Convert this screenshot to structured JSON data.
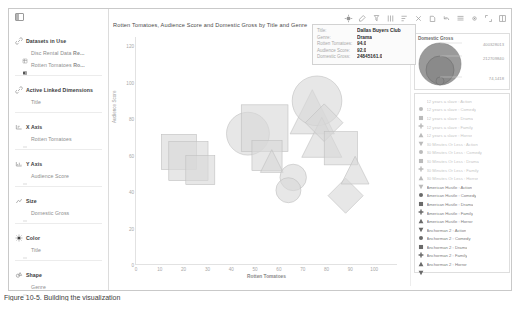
{
  "window": {
    "sidebar_collapse_icon": "panel-collapse-icon"
  },
  "sidebar": {
    "sections": [
      {
        "id": "datasets",
        "icon": "link-icon",
        "header": "Datasets in Use",
        "items": [
          {
            "icon": "database-icon",
            "label": "Disc Rental Data <b>Re..."
          },
          {
            "icon": "database-filled-icon",
            "label": "Rotten Tomatoes <b>Ro..."
          }
        ]
      },
      {
        "id": "active-linked-dimensions",
        "icon": "link-icon",
        "header": "Active Linked Dimensions",
        "items": [
          {
            "icon": "blank-icon",
            "label": "Title"
          }
        ]
      },
      {
        "id": "x-axis",
        "icon": "x-axis-icon",
        "header": "X Axis",
        "items": [
          {
            "icon": "field-icon",
            "label": "Rotten Tomatoes"
          }
        ]
      },
      {
        "id": "y-axis",
        "icon": "y-axis-icon",
        "header": "Y Axis",
        "items": [
          {
            "icon": "field-icon",
            "label": "Audience Score"
          }
        ]
      },
      {
        "id": "size",
        "icon": "size-icon",
        "header": "Size",
        "items": [
          {
            "icon": "field-icon",
            "label": "Domestic Gross"
          }
        ]
      },
      {
        "id": "color",
        "icon": "color-icon",
        "header": "Color",
        "items": [
          {
            "icon": "field-icon",
            "label": "Title"
          }
        ]
      },
      {
        "id": "shape",
        "icon": "shape-icon",
        "header": "Shape",
        "items": [
          {
            "icon": "field-icon",
            "label": "Genre"
          }
        ]
      }
    ]
  },
  "toolbar": {
    "buttons": [
      {
        "name": "pointer-tool-icon"
      },
      {
        "name": "edit-tool-icon"
      },
      {
        "name": "filter-icon"
      },
      {
        "name": "columns-icon"
      },
      {
        "name": "sort-ascending-icon"
      },
      {
        "name": "crosshair-icon"
      },
      {
        "name": "annotate-icon"
      },
      {
        "name": "undo-icon"
      },
      {
        "name": "layers-icon"
      },
      {
        "name": "settings-icon"
      },
      {
        "name": "expand-icon"
      },
      {
        "name": "fullscreen-icon"
      }
    ]
  },
  "chart_data": {
    "type": "scatter",
    "title": "Rotten Tomatoes, Audience Score and Domestic Gross by Title and Genre",
    "xlabel": "Rotten Tomatoes",
    "ylabel": "Audience Score",
    "xlim": [
      0,
      110
    ],
    "ylim": [
      0,
      125
    ],
    "xticks": [
      0,
      10,
      20,
      30,
      40,
      50,
      60,
      70,
      80,
      90,
      100
    ],
    "yticks": [
      0,
      20,
      40,
      60,
      80,
      100,
      120
    ],
    "grid": false,
    "legend_position": "right",
    "size_field": "Domestic Gross",
    "color_field": "Title",
    "shape_field": "Genre",
    "points": [
      {
        "title": "Movie A",
        "genre": "Comedy",
        "x": 18,
        "y": 62,
        "size": 70000000,
        "shape": "square"
      },
      {
        "title": "Movie B",
        "genre": "Comedy",
        "x": 22,
        "y": 57,
        "size": 95000000,
        "shape": "square"
      },
      {
        "title": "Movie C",
        "genre": "Comedy",
        "x": 27,
        "y": 52,
        "size": 40000000,
        "shape": "square"
      },
      {
        "title": "Movie D",
        "genre": "Action",
        "x": 47,
        "y": 72,
        "size": 120000000,
        "shape": "circle"
      },
      {
        "title": "Movie E",
        "genre": "Comedy",
        "x": 54,
        "y": 75,
        "size": 150000000,
        "shape": "square"
      },
      {
        "title": "Movie F",
        "genre": "Comedy",
        "x": 55,
        "y": 60,
        "size": 45000000,
        "shape": "square"
      },
      {
        "title": "Movie G",
        "genre": "Drama",
        "x": 57,
        "y": 57,
        "size": 18000000,
        "shape": "triangle"
      },
      {
        "title": "Movie H",
        "genre": "Action",
        "x": 66,
        "y": 48,
        "size": 30000000,
        "shape": "circle"
      },
      {
        "title": "Movie I",
        "genre": "Drama",
        "x": 74,
        "y": 84,
        "size": 130000000,
        "shape": "triangle"
      },
      {
        "title": "Movie J",
        "genre": "Action",
        "x": 76,
        "y": 90,
        "size": 175000000,
        "shape": "circle"
      },
      {
        "title": "Movie K",
        "genre": "Drama",
        "x": 78,
        "y": 70,
        "size": 100000000,
        "shape": "triangle"
      },
      {
        "title": "Movie L",
        "genre": "Drama",
        "x": 79,
        "y": 78,
        "size": 85000000,
        "shape": "diamond"
      },
      {
        "title": "Movie M",
        "genre": "Comedy",
        "x": 86,
        "y": 64,
        "size": 60000000,
        "shape": "square"
      },
      {
        "title": "Movie N",
        "genre": "Drama",
        "x": 88,
        "y": 38,
        "size": 70000000,
        "shape": "diamond"
      },
      {
        "title": "Movie O",
        "genre": "Action",
        "x": 64,
        "y": 41,
        "size": 25000000,
        "shape": "circle"
      },
      {
        "title": "Movie P",
        "genre": "Drama",
        "x": 92,
        "y": 52,
        "size": 35000000,
        "shape": "triangle"
      }
    ]
  },
  "tooltip": {
    "rows": [
      {
        "key": "Title:",
        "value": "Dallas Buyers Club"
      },
      {
        "key": "Genre:",
        "value": "Drama"
      },
      {
        "key": "Rotten Tomatoes:",
        "value": "94.0"
      },
      {
        "key": "Audience Score:",
        "value": "92.0"
      },
      {
        "key": "Domestic Gross:",
        "value": "24845161.0"
      }
    ]
  },
  "size_legend": {
    "title": "Domestic Gross",
    "values": [
      "400328013",
      "212709840",
      "74,1418"
    ]
  },
  "shape_legend": {
    "entries": [
      {
        "shape": "circle",
        "label": "12 years a slave : Action"
      },
      {
        "shape": "square",
        "label": "12 years a slave : Comedy"
      },
      {
        "shape": "cross",
        "label": "12 years a slave : Drama"
      },
      {
        "shape": "triangle",
        "label": "12 years a slave : Family"
      },
      {
        "shape": "triangle-down",
        "label": "12 years a slave : Horror"
      },
      {
        "shape": "circle",
        "label": "30 Minutes Or Less : Action"
      },
      {
        "shape": "square",
        "label": "30 Minutes Or Less : Comedy"
      },
      {
        "shape": "cross",
        "label": "30 Minutes Or Less : Drama"
      },
      {
        "shape": "triangle",
        "label": "30 Minutes Or Less : Family"
      },
      {
        "shape": "triangle-down",
        "label": "30 Minutes Or Less : Horror"
      },
      {
        "shape": "circle",
        "label": "American Hustle : Action"
      },
      {
        "shape": "square",
        "label": "American Hustle : Comedy"
      },
      {
        "shape": "cross",
        "label": "American Hustle : Drama"
      },
      {
        "shape": "triangle",
        "label": "American Hustle : Family"
      },
      {
        "shape": "triangle-down",
        "label": "American Hustle : Horror"
      },
      {
        "shape": "circle",
        "label": "Anchorman 2 : Action"
      },
      {
        "shape": "square",
        "label": "Anchorman 2 : Comedy"
      },
      {
        "shape": "cross",
        "label": "Anchorman 2 : Drama"
      },
      {
        "shape": "triangle",
        "label": "Anchorman 2 : Family"
      },
      {
        "shape": "triangle-down",
        "label": "Anchorman 2 : Horror"
      }
    ]
  },
  "caption": {
    "text": "Figure 10-5. Building the visualization"
  }
}
